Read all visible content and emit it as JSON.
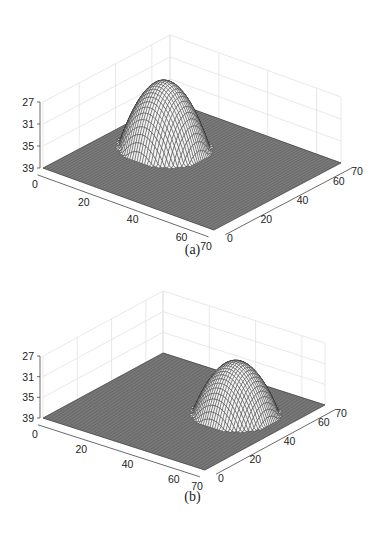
{
  "figure": {
    "panels": [
      {
        "id": "a",
        "caption": "(a)"
      },
      {
        "id": "b",
        "caption": "(b)"
      }
    ]
  },
  "chart_data": [
    {
      "type": "surface3d",
      "panel": "(a)",
      "title": "",
      "xlabel": "",
      "ylabel": "",
      "zlabel": "",
      "x_ticks": [
        "0",
        "20",
        "40",
        "60",
        "70"
      ],
      "y_ticks": [
        "0",
        "20",
        "40",
        "60",
        "70"
      ],
      "z_ticks": [
        "27",
        "31",
        "35",
        "39"
      ],
      "xlim": [
        0,
        70
      ],
      "ylim": [
        0,
        70
      ],
      "zlim": [
        39,
        27
      ],
      "z_axis_reversed": true,
      "grid": true,
      "description": "Mesh surface: flat plane at z=39 with a single dome (paraboloid cap) rising to about z=27, centered near x=20, y=40",
      "dome": {
        "center_x": 20,
        "center_y": 40,
        "radius": 15,
        "peak_z": 27,
        "base_z": 39
      }
    },
    {
      "type": "surface3d",
      "panel": "(b)",
      "title": "",
      "xlabel": "",
      "ylabel": "",
      "zlabel": "",
      "x_ticks": [
        "0",
        "20",
        "40",
        "60",
        "70"
      ],
      "y_ticks": [
        "0",
        "20",
        "40",
        "60",
        "70"
      ],
      "z_ticks": [
        "27",
        "31",
        "35",
        "39"
      ],
      "xlim": [
        0,
        70
      ],
      "ylim": [
        0,
        70
      ],
      "zlim": [
        39,
        27
      ],
      "z_axis_reversed": true,
      "grid": true,
      "description": "Mesh surface: flat plane at z=39 with a single dome rising to about z=29, centered near x=50, y=45",
      "dome": {
        "center_x": 50,
        "center_y": 45,
        "radius": 15,
        "peak_z": 29,
        "base_z": 39
      }
    }
  ]
}
